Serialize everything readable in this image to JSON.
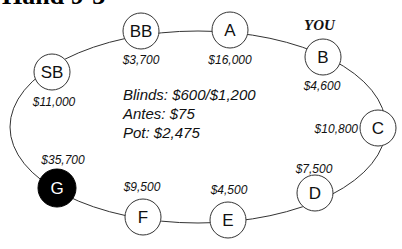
{
  "title": "Hand 9-3",
  "you_label": "YOU",
  "info": {
    "blinds": "Blinds: $600/$1,200",
    "antes": "Antes: $75",
    "pot": "Pot: $2,475"
  },
  "seats": [
    {
      "id": "SB",
      "label": "SB",
      "stack": "$11,000",
      "dealer": false
    },
    {
      "id": "BB",
      "label": "BB",
      "stack": "$3,700",
      "dealer": false
    },
    {
      "id": "A",
      "label": "A",
      "stack": "$16,000",
      "dealer": false
    },
    {
      "id": "B",
      "label": "B",
      "stack": "$4,600",
      "dealer": false,
      "hero": true
    },
    {
      "id": "C",
      "label": "C",
      "stack": "$10,800",
      "dealer": false
    },
    {
      "id": "D",
      "label": "D",
      "stack": "$7,500",
      "dealer": false
    },
    {
      "id": "E",
      "label": "E",
      "stack": "$4,500",
      "dealer": false
    },
    {
      "id": "F",
      "label": "F",
      "stack": "$9,500",
      "dealer": false
    },
    {
      "id": "G",
      "label": "G",
      "stack": "$35,700",
      "dealer": true
    }
  ],
  "colors": {
    "dealer_fill": "#000000",
    "seat_fill": "#ffffff",
    "line": "#333333"
  }
}
